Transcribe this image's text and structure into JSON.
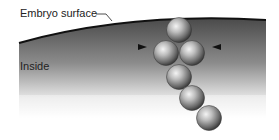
{
  "diagram": {
    "labels": {
      "surface": "Embryo surface",
      "inside": "Inside"
    },
    "region": {
      "name": "embryo-interior",
      "gradient_top": "#4a4a4a",
      "gradient_mid": "#9a9a9a",
      "gradient_bottom": "#ffffff"
    },
    "surface_line_color": "#111111",
    "arrowheads": [
      {
        "side": "left",
        "direction": "right",
        "x": 146,
        "y": 47
      },
      {
        "side": "right",
        "direction": "left",
        "x": 213,
        "y": 47
      }
    ],
    "spheres": [
      {
        "id": 1,
        "cx": 179,
        "cy": 30,
        "r": 12.5
      },
      {
        "id": 2,
        "cx": 166,
        "cy": 53,
        "r": 12.5
      },
      {
        "id": 3,
        "cx": 192,
        "cy": 53,
        "r": 12.5
      },
      {
        "id": 4,
        "cx": 179,
        "cy": 77,
        "r": 12.5
      },
      {
        "id": 5,
        "cx": 192,
        "cy": 98,
        "r": 12.5
      },
      {
        "id": 6,
        "cx": 209,
        "cy": 118,
        "r": 12.5
      }
    ],
    "sphere_colors": {
      "highlight": "#f4f4f4",
      "mid": "#9c9c9c",
      "shadow": "#2e2e2e"
    }
  }
}
